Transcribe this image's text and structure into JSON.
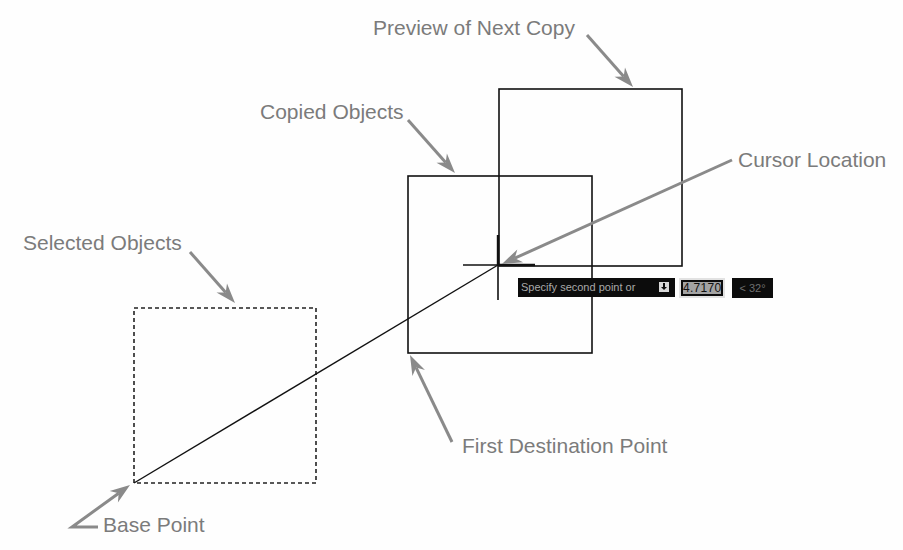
{
  "labels": {
    "preview_next_copy": "Preview of Next Copy",
    "copied_objects": "Copied Objects",
    "cursor_location": "Cursor Location",
    "selected_objects": "Selected Objects",
    "base_point": "Base Point",
    "first_destination_point": "First Destination Point"
  },
  "dynamic_input": {
    "prompt": "Specify second point or",
    "options_icon": "down-arrow-icon",
    "distance_value": "4.7170",
    "angle_value": "< 32°"
  },
  "colors": {
    "background": "#fefefe",
    "geometry": "#111111",
    "annotation_arrow": "#8a8a8a",
    "annotation_text": "#7b7b7b",
    "tooltip_background": "#0c0c0c"
  }
}
